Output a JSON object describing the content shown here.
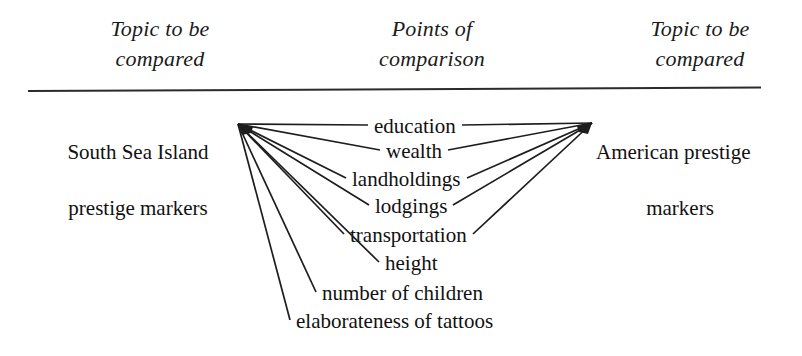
{
  "diagram": {
    "type": "comparison-point-by-point",
    "headers": {
      "left": "Topic to be\ncompared",
      "middle": "Points of\ncomparison",
      "right": "Topic to be\ncompared"
    },
    "left_topic": {
      "line1": "South Sea Island",
      "line2": "prestige markers",
      "full": "South Sea Island prestige markers"
    },
    "right_topic": {
      "line1": "American prestige",
      "line2": "markers",
      "full": "American prestige markers"
    },
    "points": [
      {
        "label": "education",
        "x": 374,
        "y": 131,
        "connects_left": true,
        "connects_right": true
      },
      {
        "label": "wealth",
        "x": 386,
        "y": 156,
        "connects_left": true,
        "connects_right": true
      },
      {
        "label": "landholdings",
        "x": 352,
        "y": 184,
        "connects_left": true,
        "connects_right": true
      },
      {
        "label": "lodgings",
        "x": 375,
        "y": 211,
        "connects_left": true,
        "connects_right": true
      },
      {
        "label": "transportation",
        "x": 350,
        "y": 240,
        "connects_left": true,
        "connects_right": true
      },
      {
        "label": "height",
        "x": 385,
        "y": 268,
        "connects_left": true,
        "connects_right": false
      },
      {
        "label": "number of children",
        "x": 322,
        "y": 298,
        "connects_left": true,
        "connects_right": false
      },
      {
        "label": "elaborateness of tattoos",
        "x": 296,
        "y": 326,
        "connects_left": true,
        "connects_right": false
      }
    ],
    "colors": {
      "ink": "#1d1d1d",
      "text": "#111111",
      "background": "#ffffff",
      "rule": "#2b2b2b"
    },
    "hubs": {
      "left": {
        "x": 238,
        "y": 124
      },
      "right": {
        "x": 592,
        "y": 123
      }
    }
  }
}
